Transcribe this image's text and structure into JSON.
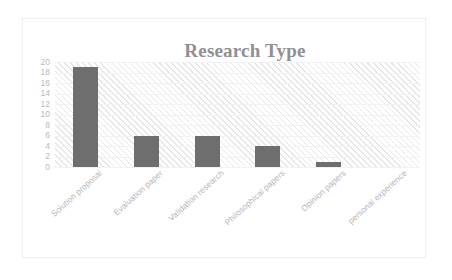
{
  "chart_data": {
    "type": "bar",
    "title": "Research Type",
    "xlabel": "",
    "ylabel": "",
    "categories": [
      "Solution proposal",
      "Evaluation paper",
      "Validation research",
      "Philosophical papers",
      "Opinion papers",
      "personal experience"
    ],
    "values": [
      19,
      6,
      6,
      4,
      1,
      0
    ],
    "ylim": [
      0,
      20
    ],
    "ytick_step": 2,
    "yticks": [
      20,
      18,
      16,
      14,
      12,
      10,
      8,
      6,
      4,
      2,
      0
    ],
    "grid": true,
    "legend": false,
    "legend_position": "none",
    "series": [
      {
        "name": "Research Type",
        "values": [
          19,
          6,
          6,
          4,
          1,
          0
        ]
      }
    ],
    "colors": {
      "bar": "#6e6e6e",
      "title": "#909094",
      "tick_label": "#b9b9bd",
      "plot_background": "#ffffff",
      "plot_hatch": "#e7e7ea",
      "frame_border": "#f0f0f2"
    },
    "xtick_rotation": -42
  }
}
